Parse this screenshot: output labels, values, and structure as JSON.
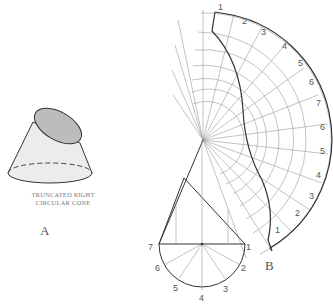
{
  "figure_a": {
    "caption_line1": "TRUNCATED RIGHT",
    "caption_line2": "CIRCULAR CONE",
    "label": "A"
  },
  "figure_b": {
    "label": "B",
    "outer_arc_numbers": [
      "1",
      "2",
      "3",
      "4",
      "5",
      "6",
      "7",
      "6",
      "5",
      "4",
      "3",
      "2",
      "1"
    ],
    "base_circle_numbers": [
      "1",
      "2",
      "3",
      "4",
      "5",
      "6",
      "7"
    ]
  },
  "colors": {
    "line": "#333333",
    "thin_line": "#9a9a9a",
    "cone_fill": "#e6e6e6",
    "cut_face_fill": "#bdbdbd"
  }
}
